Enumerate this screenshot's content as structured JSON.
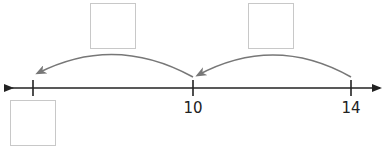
{
  "number_line": {
    "labels": [
      {
        "value": "",
        "x": 33
      },
      {
        "value": "10",
        "x": 193
      },
      {
        "value": "14",
        "x": 351
      }
    ],
    "line_color": "#222222",
    "arrow_color": "#777777",
    "box_border_color": "#c8c8c8"
  },
  "answer_boxes": [
    {
      "id": "jump-1",
      "value": ""
    },
    {
      "id": "jump-2",
      "value": ""
    },
    {
      "id": "result",
      "value": ""
    }
  ]
}
